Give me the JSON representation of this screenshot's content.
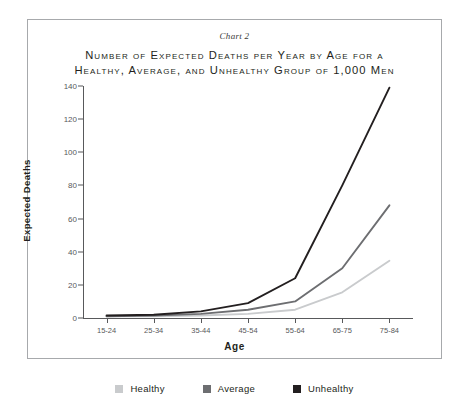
{
  "figure": {
    "chart_label": "Chart 2",
    "title_line_1": "Number of Expected Deaths per Year by Age for a",
    "title_line_2": "Healthy, Average, and Unhealthy Group of 1,000 Men"
  },
  "legend": {
    "items": [
      {
        "label": "Healthy",
        "color": "#c9cbcd"
      },
      {
        "label": "Average",
        "color": "#6d6e71"
      },
      {
        "label": "Unhealthy",
        "color": "#231f20"
      }
    ]
  },
  "colors": {
    "frame": "#a7a9ac",
    "axis": "#58595b",
    "text": "#231f20",
    "healthy": "#c9cbcd",
    "average": "#6d6e71",
    "unhealthy": "#231f20"
  },
  "chart_data": {
    "type": "line",
    "title": "Number of Expected Deaths per Year by Age for a Healthy, Average, and Unhealthy Group of 1,000 Men",
    "subtitle": "Chart 2",
    "xlabel": "Age",
    "ylabel": "Expected Deaths",
    "categories": [
      "15-24",
      "25-34",
      "35-44",
      "45-54",
      "55-64",
      "65-75",
      "75-84"
    ],
    "ytick_labels": [
      "0",
      "20",
      "40",
      "60",
      "80",
      "100",
      "120",
      "140"
    ],
    "ytick_values": [
      0,
      20,
      40,
      60,
      80,
      100,
      120,
      140
    ],
    "ylim": [
      0,
      140
    ],
    "grid": false,
    "legend_position": "bottom",
    "series": [
      {
        "name": "Healthy",
        "color": "#c9cbcd",
        "values": [
          1,
          1,
          1.5,
          2.5,
          5,
          15.5,
          34.5
        ]
      },
      {
        "name": "Average",
        "color": "#6d6e71",
        "values": [
          1,
          1.5,
          2.5,
          5,
          10,
          30,
          68
        ]
      },
      {
        "name": "Unhealthy",
        "color": "#231f20",
        "values": [
          1.5,
          2,
          4,
          9,
          24,
          80,
          139
        ]
      }
    ]
  }
}
